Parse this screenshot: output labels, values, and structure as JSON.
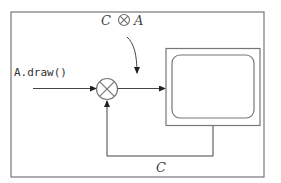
{
  "diagram": {
    "input_label": "A.draw()",
    "top_label_left": "C",
    "top_label_operator": "⊗",
    "top_label_right": "A",
    "feedback_label": "C",
    "nodes": [
      {
        "id": "compositor",
        "type": "circle-times",
        "description": "compositing operator"
      },
      {
        "id": "display",
        "type": "monitor",
        "description": "screen"
      }
    ],
    "edges": [
      {
        "from": "input",
        "to": "compositor",
        "label": "A.draw()"
      },
      {
        "from": "compositor",
        "to": "display"
      },
      {
        "from": "display",
        "to": "compositor",
        "label": "C"
      },
      {
        "from": "top-label",
        "to": "output-line",
        "label": "C ⊗ A"
      }
    ]
  }
}
